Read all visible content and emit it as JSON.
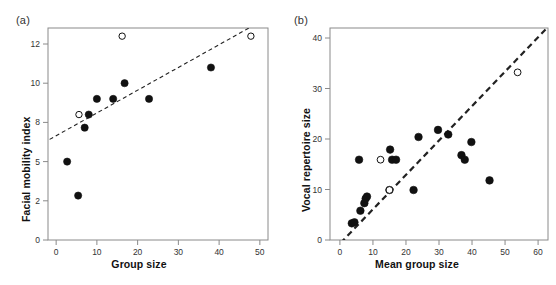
{
  "figure": {
    "width": 556,
    "height": 285,
    "background": "#ffffff",
    "marker_fill_color": "#111111",
    "marker_open_color": "#ffffff",
    "line_color": "#222222"
  },
  "panels": [
    {
      "letter": "(a)",
      "xlabel": "Group size",
      "ylabel": "Facial mobility index"
    },
    {
      "letter": "(b)",
      "xlabel": "Mean group size",
      "ylabel": "Vocal repertoire size"
    }
  ],
  "chart_data": [
    {
      "type": "scatter",
      "panel": "(a)",
      "title": "",
      "xlabel": "Group size",
      "ylabel": "Facial mobility index",
      "xlim": [
        -2,
        52
      ],
      "ylim": [
        0,
        13.6
      ],
      "xticks": [
        0,
        10,
        20,
        30,
        40,
        50
      ],
      "yticks": [
        0,
        2,
        5,
        8,
        10,
        12
      ],
      "grid": false,
      "legend": null,
      "frame": "box",
      "series": [
        {
          "name": "filled-points",
          "marker": "filled-circle",
          "points": [
            {
              "x": 2.7,
              "y": 5.0
            },
            {
              "x": 5.4,
              "y": 2.4
            },
            {
              "x": 7.0,
              "y": 7.6
            },
            {
              "x": 8.0,
              "y": 8.4
            },
            {
              "x": 10.0,
              "y": 9.2
            },
            {
              "x": 14.0,
              "y": 9.2
            },
            {
              "x": 16.8,
              "y": 10.0
            },
            {
              "x": 22.8,
              "y": 9.2
            },
            {
              "x": 38.0,
              "y": 10.8
            }
          ]
        },
        {
          "name": "open-points",
          "marker": "open-circle",
          "points": [
            {
              "x": 5.6,
              "y": 8.4
            },
            {
              "x": 16.2,
              "y": 12.4
            },
            {
              "x": 47.8,
              "y": 12.4
            }
          ]
        }
      ],
      "trendline": {
        "style": "dashed",
        "x_start": -1.6,
        "y_start": 6.7,
        "x_end": 51.5,
        "y_end": 13.3
      }
    },
    {
      "type": "scatter",
      "panel": "(b)",
      "title": "",
      "xlabel": "Mean group size",
      "ylabel": "Vocal repertoire size",
      "xlim": [
        -3,
        63
      ],
      "ylim": [
        0,
        42.5
      ],
      "xticks": [
        0,
        10,
        20,
        30,
        40,
        50,
        60
      ],
      "yticks": [
        0,
        10,
        20,
        30,
        40
      ],
      "grid": false,
      "legend": null,
      "frame": "box",
      "series": [
        {
          "name": "filled-points",
          "marker": "filled-circle",
          "points": [
            {
              "x": 3.6,
              "y": 3.3
            },
            {
              "x": 4.4,
              "y": 3.5
            },
            {
              "x": 6.2,
              "y": 5.8
            },
            {
              "x": 7.4,
              "y": 7.3
            },
            {
              "x": 7.8,
              "y": 8.2
            },
            {
              "x": 8.2,
              "y": 8.6
            },
            {
              "x": 5.8,
              "y": 15.9
            },
            {
              "x": 15.2,
              "y": 17.9
            },
            {
              "x": 15.8,
              "y": 15.9
            },
            {
              "x": 17.0,
              "y": 15.9
            },
            {
              "x": 15.0,
              "y": 9.9
            },
            {
              "x": 22.3,
              "y": 9.9
            },
            {
              "x": 23.8,
              "y": 20.4
            },
            {
              "x": 29.7,
              "y": 21.8
            },
            {
              "x": 32.8,
              "y": 20.9
            },
            {
              "x": 36.8,
              "y": 16.8
            },
            {
              "x": 37.8,
              "y": 15.9
            },
            {
              "x": 39.8,
              "y": 19.4
            },
            {
              "x": 45.3,
              "y": 11.8
            }
          ]
        },
        {
          "name": "open-points",
          "marker": "open-circle",
          "points": [
            {
              "x": 12.3,
              "y": 15.9
            },
            {
              "x": 15.0,
              "y": 9.9
            },
            {
              "x": 53.8,
              "y": 33.2
            }
          ]
        }
      ],
      "trendline": {
        "style": "dashed",
        "x_start": 0.2,
        "y_start": -0.6,
        "x_end": 63.0,
        "y_end": 42.2
      }
    }
  ]
}
